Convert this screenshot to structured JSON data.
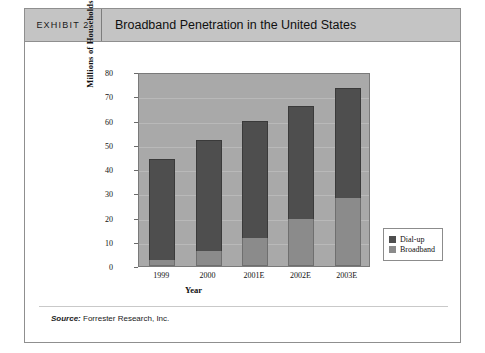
{
  "exhibit": {
    "tag": "EXHIBIT 2",
    "title": "Broadband Penetration in the United States"
  },
  "source": {
    "label": "Source:",
    "text": " Forrester Research, Inc."
  },
  "colors": {
    "dialup": "#4e4e4e",
    "broadband": "#8b8b8b",
    "plot_background": "#a9a9a9",
    "header_background": "#c4c4c4"
  },
  "chart_data": {
    "type": "bar",
    "stacked": true,
    "title": "Broadband Penetration in the United States",
    "xlabel": "Year",
    "ylabel": "Millions of Households",
    "categories": [
      "1999",
      "2000",
      "2001E",
      "2002E",
      "2003E"
    ],
    "series": [
      {
        "name": "Broadband",
        "values": [
          2.5,
          6,
          11.5,
          19.5,
          28
        ]
      },
      {
        "name": "Dial-up",
        "values": [
          41.5,
          46,
          48.5,
          46.5,
          45.5
        ]
      }
    ],
    "totals": [
      44,
      52,
      60,
      66,
      73.5
    ],
    "ylim": [
      0,
      80
    ],
    "yticks": [
      0,
      10,
      20,
      30,
      40,
      50,
      60,
      70,
      80
    ],
    "grid": true,
    "legend_position": "right",
    "legend": [
      "Dial-up",
      "Broadband"
    ]
  }
}
